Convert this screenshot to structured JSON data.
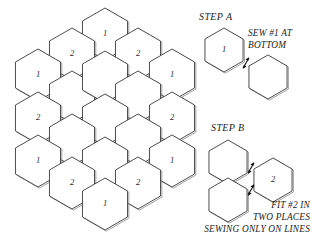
{
  "diagram": {
    "background_color": "#ffffff",
    "line_color": "#3a3a3a",
    "text_color": "#1c1c1c"
  },
  "grid": {
    "name": "hexagon-quilt-layout",
    "hex_radius": 26,
    "labels_used": [
      "1",
      "2"
    ],
    "cells": [
      {
        "id": "hex-top-1",
        "cx": 105,
        "cy": 34,
        "label": "1"
      },
      {
        "id": "hex-upper-left-2",
        "cx": 72,
        "cy": 54,
        "label": "2"
      },
      {
        "id": "hex-upper-right-2",
        "cx": 138,
        "cy": 54,
        "label": "2"
      },
      {
        "id": "hex-left-1",
        "cx": 38,
        "cy": 75,
        "label": "1"
      },
      {
        "id": "hex-right-1",
        "cx": 172,
        "cy": 75,
        "label": "1"
      },
      {
        "id": "hex-mid-ul",
        "cx": 72,
        "cy": 97,
        "label": ""
      },
      {
        "id": "hex-center-top",
        "cx": 105,
        "cy": 77,
        "label": ""
      },
      {
        "id": "hex-mid-ur",
        "cx": 138,
        "cy": 97,
        "label": ""
      },
      {
        "id": "hex-left-2",
        "cx": 38,
        "cy": 118,
        "label": "2"
      },
      {
        "id": "hex-center",
        "cx": 105,
        "cy": 120,
        "label": ""
      },
      {
        "id": "hex-right-2",
        "cx": 172,
        "cy": 118,
        "label": "2"
      },
      {
        "id": "hex-mid-ll",
        "cx": 72,
        "cy": 140,
        "label": ""
      },
      {
        "id": "hex-mid-lr",
        "cx": 138,
        "cy": 140,
        "label": ""
      },
      {
        "id": "hex-lower-left-1",
        "cx": 38,
        "cy": 161,
        "label": "1"
      },
      {
        "id": "hex-center-bot",
        "cx": 105,
        "cy": 163,
        "label": ""
      },
      {
        "id": "hex-lower-right-1",
        "cx": 172,
        "cy": 161,
        "label": "1"
      },
      {
        "id": "hex-lower-left-2",
        "cx": 72,
        "cy": 183,
        "label": "2"
      },
      {
        "id": "hex-lower-right-2",
        "cx": 138,
        "cy": 183,
        "label": "2"
      },
      {
        "id": "hex-bottom-1",
        "cx": 105,
        "cy": 204,
        "label": "1"
      }
    ]
  },
  "step_a": {
    "title": "STEP  A",
    "title_x": 199,
    "title_y": 20,
    "note_lines": [
      "SEW #1 AT",
      "BOTTOM"
    ],
    "note_x": 248,
    "note_y": 36,
    "hexes": [
      {
        "id": "step-a-hex-1",
        "cx": 224,
        "cy": 50,
        "label": "1"
      },
      {
        "id": "step-a-hex-new",
        "cx": 268,
        "cy": 77,
        "label": ""
      }
    ],
    "arrows": [
      {
        "id": "step-a-join-arrow",
        "x": 246,
        "y": 63
      }
    ]
  },
  "step_b": {
    "title": "STEP  B",
    "title_x": 211,
    "title_y": 131,
    "note_lines": [
      "FIT #2 IN",
      "TWO PLACES",
      "SEWING ONLY ON LINES"
    ],
    "note_x": 310,
    "note_y": 208,
    "hexes": [
      {
        "id": "step-b-hex-upper",
        "cx": 228,
        "cy": 162,
        "label": ""
      },
      {
        "id": "step-b-hex-lower",
        "cx": 228,
        "cy": 200,
        "label": ""
      },
      {
        "id": "step-b-hex-2",
        "cx": 273,
        "cy": 180,
        "label": "2"
      }
    ],
    "arrows": [
      {
        "id": "step-b-join-arrow-top",
        "x": 251,
        "y": 168
      },
      {
        "id": "step-b-join-arrow-bottom",
        "x": 251,
        "y": 190
      }
    ]
  }
}
